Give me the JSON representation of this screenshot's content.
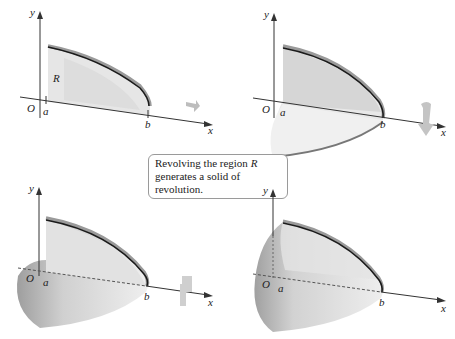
{
  "caption": {
    "line1_prefix": "Revolving the region ",
    "line1_var": "R",
    "line2": "generates a solid of revolution."
  },
  "labels": {
    "y_axis": "y",
    "x_axis": "x",
    "origin": "O",
    "a": "a",
    "b": "b",
    "region": "R"
  },
  "panels": [
    {
      "id": "top-left",
      "stage": "flat region R"
    },
    {
      "id": "top-right",
      "stage": "partially revolved (half)"
    },
    {
      "id": "bottom-left",
      "stage": "mostly revolved"
    },
    {
      "id": "bottom-right",
      "stage": "fully revolved solid"
    }
  ],
  "colors": {
    "surface_light": "#ececec",
    "surface_mid": "#d4d4d4",
    "surface_dark": "#a8a8a8",
    "curve": "#1a1a1a",
    "axis": "#333333",
    "arrow": "#c4c4c4"
  }
}
